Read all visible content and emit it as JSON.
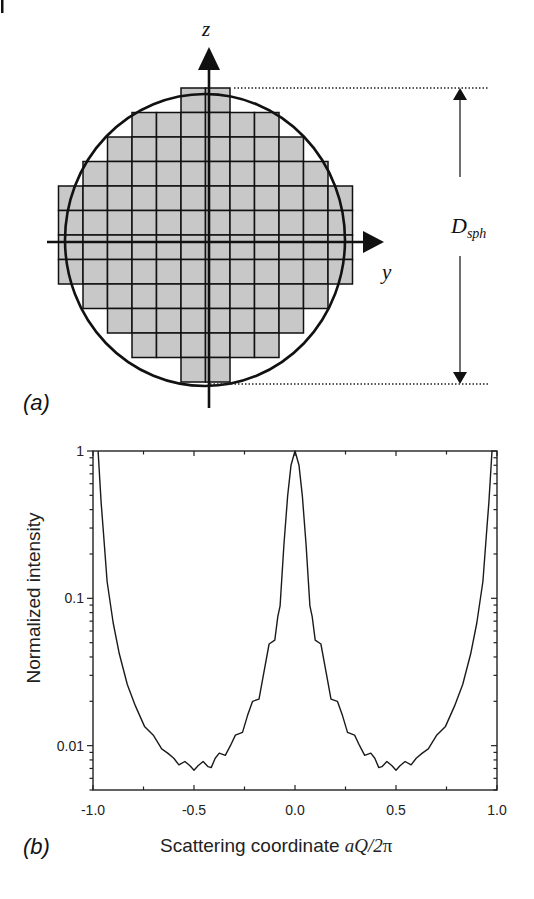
{
  "figure": {
    "corner_mark": "|",
    "panel_a": {
      "label": "(a)",
      "z_axis_label": "z",
      "y_axis_label": "y",
      "diameter_label_main": "D",
      "diameter_label_sub": "sph",
      "grid": {
        "cell_size_px": 24.5,
        "rows": [
          {
            "start_col": 5,
            "end_col": 6
          },
          {
            "start_col": 3,
            "end_col": 8
          },
          {
            "start_col": 2,
            "end_col": 9
          },
          {
            "start_col": 1,
            "end_col": 10
          },
          {
            "start_col": 0,
            "end_col": 11
          },
          {
            "start_col": 0,
            "end_col": 11
          },
          {
            "start_col": 0,
            "end_col": 11
          },
          {
            "start_col": 0,
            "end_col": 11
          },
          {
            "start_col": 1,
            "end_col": 10
          },
          {
            "start_col": 2,
            "end_col": 9
          },
          {
            "start_col": 3,
            "end_col": 8
          },
          {
            "start_col": 5,
            "end_col": 6
          }
        ]
      },
      "colors": {
        "cell_fill": "#c8c8c8",
        "line": "#111111"
      }
    },
    "panel_b": {
      "label": "(b)"
    }
  },
  "chart_data": {
    "type": "line",
    "title": "",
    "xlabel": "Scattering coordinate aQ/2π",
    "xlabel_prefix": "Scattering coordinate ",
    "xlabel_math": "aQ/2",
    "xlabel_pi": "π",
    "ylabel": "Normalized intensity",
    "xlim": [
      -1.0,
      1.0
    ],
    "ylim": [
      0.005,
      1
    ],
    "yscale": "log",
    "grid": false,
    "legend": null,
    "x_ticks": [
      -1.0,
      -0.5,
      0.0,
      0.5,
      1.0
    ],
    "x_tick_labels": [
      "-1.0",
      "-0.5",
      "0.0",
      "0.5",
      "1.0"
    ],
    "y_ticks": [
      1,
      0.1,
      0.01
    ],
    "y_tick_labels": [
      "1",
      "0.1",
      "0.01"
    ],
    "symmetric_about_zero": true,
    "series": [
      {
        "name": "Normalized intensity",
        "color": "#1a1a1a",
        "half_points_negative_x": [
          [
            -0.975,
            1.0
          ],
          [
            -0.96,
            0.45
          ],
          [
            -0.95,
            0.3
          ],
          [
            -0.93,
            0.13
          ],
          [
            -0.9,
            0.068
          ],
          [
            -0.87,
            0.042
          ],
          [
            -0.83,
            0.026
          ],
          [
            -0.79,
            0.0186
          ],
          [
            -0.745,
            0.0135
          ],
          [
            -0.7,
            0.0117
          ],
          [
            -0.66,
            0.0095
          ],
          [
            -0.63,
            0.0089
          ],
          [
            -0.6,
            0.0082
          ],
          [
            -0.575,
            0.0074
          ],
          [
            -0.545,
            0.0078
          ],
          [
            -0.52,
            0.0073
          ],
          [
            -0.5,
            0.0068
          ],
          [
            -0.48,
            0.0073
          ],
          [
            -0.455,
            0.0078
          ],
          [
            -0.43,
            0.0072
          ],
          [
            -0.415,
            0.0071
          ],
          [
            -0.395,
            0.0082
          ],
          [
            -0.375,
            0.0089
          ],
          [
            -0.345,
            0.0086
          ],
          [
            -0.32,
            0.01
          ],
          [
            -0.295,
            0.0118
          ],
          [
            -0.26,
            0.0123
          ],
          [
            -0.235,
            0.016
          ],
          [
            -0.21,
            0.02
          ],
          [
            -0.178,
            0.0207
          ],
          [
            -0.155,
            0.031
          ],
          [
            -0.128,
            0.049
          ],
          [
            -0.1,
            0.052
          ],
          [
            -0.085,
            0.075
          ],
          [
            -0.074,
            0.089
          ],
          [
            -0.055,
            0.23
          ],
          [
            -0.036,
            0.5
          ],
          [
            -0.02,
            0.8
          ],
          [
            0.0,
            1.0
          ]
        ]
      }
    ]
  }
}
